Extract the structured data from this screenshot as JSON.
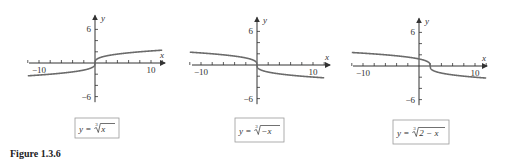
{
  "figure": {
    "caption": "Figure 1.3.6"
  },
  "chart_data": [
    {
      "type": "line",
      "title": "y = ∛x",
      "function": "cbrt(x)",
      "xlabel": "x",
      "ylabel": "y",
      "xlim": [
        -12,
        12
      ],
      "ylim": [
        -7,
        7
      ],
      "x_ticks_labeled": [
        -10,
        10
      ],
      "y_ticks_labeled": [
        6,
        -6
      ],
      "x_tick_step": 2,
      "y_tick_step": 2,
      "x": [
        -12,
        -10,
        -8,
        -6,
        -4,
        -2,
        -1,
        0,
        1,
        2,
        4,
        6,
        8,
        10,
        12
      ],
      "y": [
        -2.29,
        -2.15,
        -2,
        -1.82,
        -1.59,
        -1.26,
        -1,
        0,
        1,
        1.26,
        1.59,
        1.82,
        2,
        2.15,
        2.29
      ],
      "grid": false
    },
    {
      "type": "line",
      "title": "y = ∛(−x)",
      "function": "cbrt(-x)",
      "xlabel": "x",
      "ylabel": "y",
      "xlim": [
        -12,
        12
      ],
      "ylim": [
        -7,
        7
      ],
      "x_ticks_labeled": [
        -10,
        10
      ],
      "y_ticks_labeled": [
        6,
        -6
      ],
      "x_tick_step": 2,
      "y_tick_step": 2,
      "x": [
        -12,
        -10,
        -8,
        -6,
        -4,
        -2,
        -1,
        0,
        1,
        2,
        4,
        6,
        8,
        10,
        12
      ],
      "y": [
        2.29,
        2.15,
        2,
        1.82,
        1.59,
        1.26,
        1,
        0,
        -1,
        -1.26,
        -1.59,
        -1.82,
        -2,
        -2.15,
        -2.29
      ],
      "grid": false
    },
    {
      "type": "line",
      "title": "y = ∛(2 − x)",
      "function": "cbrt(2-x)",
      "xlabel": "x",
      "ylabel": "y",
      "xlim": [
        -12,
        12
      ],
      "ylim": [
        -7,
        7
      ],
      "x_ticks_labeled": [
        -10,
        10
      ],
      "y_ticks_labeled": [
        6,
        -6
      ],
      "x_tick_step": 2,
      "y_tick_step": 2,
      "x": [
        -12,
        -10,
        -8,
        -6,
        -4,
        -2,
        0,
        1,
        2,
        3,
        4,
        6,
        8,
        10,
        12
      ],
      "y": [
        2.41,
        2.29,
        2.15,
        2,
        1.82,
        1.59,
        1.26,
        1,
        0,
        -1,
        -1.26,
        -1.59,
        -1.82,
        -2,
        -2.15
      ],
      "grid": false
    }
  ],
  "panels": [
    {
      "label_lhs": "y =",
      "label_index": "3",
      "label_radicand": "x",
      "tick_neg": "−10",
      "tick_pos": "10",
      "tick_top": "6",
      "tick_bottom": "−6",
      "axis_x": "x",
      "axis_y": "y"
    },
    {
      "label_lhs": "y =",
      "label_index": "3",
      "label_radicand": "−x",
      "tick_neg": "−10",
      "tick_pos": "10",
      "tick_top": "6",
      "tick_bottom": "−6",
      "axis_x": "x",
      "axis_y": "y"
    },
    {
      "label_lhs": "y =",
      "label_index": "3",
      "label_radicand": "2 − x",
      "tick_neg": "−10",
      "tick_pos": "10",
      "tick_top": "6",
      "tick_bottom": "−6",
      "axis_x": "x",
      "axis_y": "y"
    }
  ],
  "colors": {
    "curve": "#6b6b6b",
    "axis": "#333333",
    "box": "#999999"
  }
}
